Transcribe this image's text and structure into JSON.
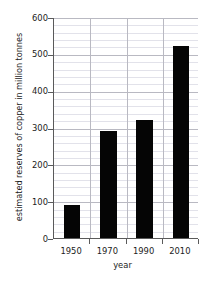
{
  "chart_data": {
    "type": "bar",
    "title": "",
    "categories": [
      "1950",
      "1970",
      "1990",
      "2010"
    ],
    "values": [
      90,
      290,
      320,
      520
    ],
    "series": [
      {
        "name": "estimated reserves of copper",
        "values": [
          90,
          290,
          320,
          520
        ]
      }
    ],
    "xlabel": "year",
    "ylabel": "estimated reserves of copper in million tonnes",
    "ylim": [
      0,
      600
    ],
    "ytick_labels": [
      "0",
      "100",
      "200",
      "300",
      "400",
      "500",
      "600"
    ],
    "ytick_values": [
      0,
      100,
      200,
      300,
      400,
      500,
      600
    ],
    "ytick_minor_step": 20,
    "grid": true,
    "legend": "none",
    "bar_color": "#050505",
    "grid_color": "#b9b9c2",
    "minor_grid_color": "#e2e2ea",
    "axis_color": "#5a5a5a",
    "background": "#ffffff"
  }
}
